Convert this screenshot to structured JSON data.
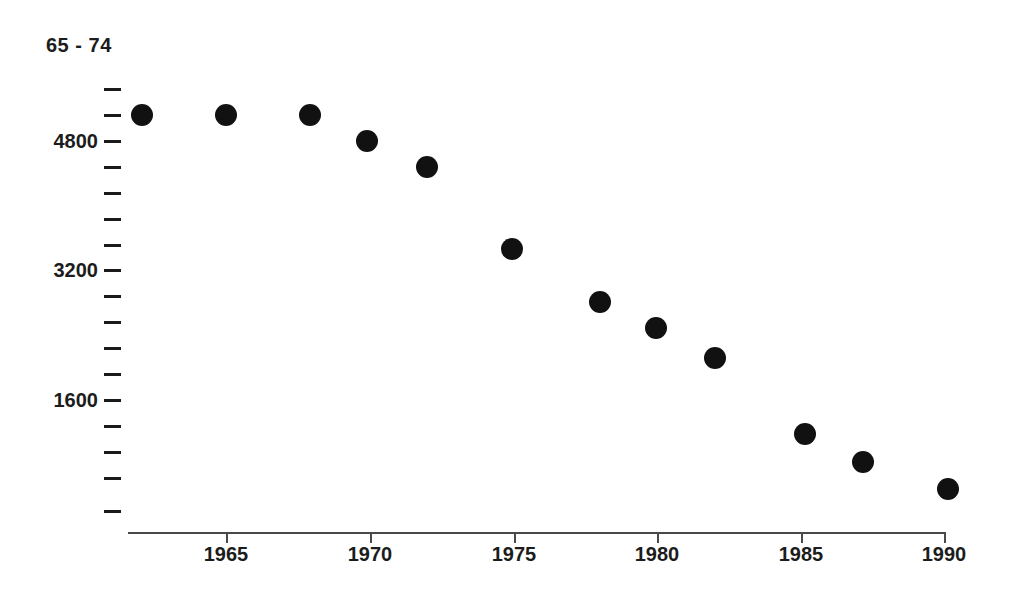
{
  "chart_data": {
    "type": "scatter",
    "title": "65 - 74",
    "xlabel": "",
    "ylabel": "",
    "grid": false,
    "legend_position": "none",
    "marker": {
      "shape": "circle",
      "color": "#111111",
      "size_px": 22
    },
    "axis_color": "#4a4a4a",
    "text_color": "#1c1c1c",
    "background_color": "#ffffff",
    "xlim": [
      1961,
      1991
    ],
    "ylim": [
      0,
      5600
    ],
    "x_tick_labels": [
      "1965",
      "1970",
      "1975",
      "1980",
      "1985",
      "1990"
    ],
    "x_tick_values": [
      1965,
      1970,
      1975,
      1980,
      1985,
      1990
    ],
    "y_tick_labels": [
      "4800",
      "3200",
      "1600"
    ],
    "y_tick_values": [
      4800,
      3200,
      1600
    ],
    "y_minor_tick_values": [
      5440,
      5120,
      4480,
      4160,
      3840,
      3520,
      2880,
      2560,
      2240,
      1920,
      1280,
      960,
      640,
      320
    ],
    "y_tick_step": 320,
    "x": [
      1962,
      1965,
      1968,
      1970,
      1972,
      1975,
      1978,
      1980,
      1982,
      1985,
      1987,
      1990
    ],
    "values": [
      5120,
      5120,
      5120,
      4800,
      4480,
      3470,
      2800,
      2480,
      2120,
      1180,
      830,
      500
    ],
    "points": [
      {
        "x": 1962,
        "y": 5120
      },
      {
        "x": 1965,
        "y": 5120
      },
      {
        "x": 1968,
        "y": 5120
      },
      {
        "x": 1970,
        "y": 4800
      },
      {
        "x": 1972,
        "y": 4480
      },
      {
        "x": 1975,
        "y": 3470
      },
      {
        "x": 1978,
        "y": 2800
      },
      {
        "x": 1980,
        "y": 2480
      },
      {
        "x": 1982,
        "y": 2120
      },
      {
        "x": 1985,
        "y": 1180
      },
      {
        "x": 1987,
        "y": 830
      },
      {
        "x": 1990,
        "y": 500
      }
    ]
  },
  "layout": {
    "series_label": {
      "text": "65 - 74",
      "left": 46,
      "top": 34
    },
    "y_axis": {
      "tick_x": 104,
      "label_right": 98,
      "ticks": [
        {
          "label": "",
          "y": 89
        },
        {
          "label": "",
          "y": 115
        },
        {
          "label": "4800",
          "y": 141
        },
        {
          "label": "",
          "y": 167
        },
        {
          "label": "",
          "y": 193
        },
        {
          "label": "",
          "y": 219
        },
        {
          "label": "",
          "y": 245
        },
        {
          "label": "3200",
          "y": 270
        },
        {
          "label": "",
          "y": 296
        },
        {
          "label": "",
          "y": 322
        },
        {
          "label": "",
          "y": 348
        },
        {
          "label": "",
          "y": 374
        },
        {
          "label": "1600",
          "y": 400
        },
        {
          "label": "",
          "y": 426
        },
        {
          "label": "",
          "y": 452
        },
        {
          "label": "",
          "y": 478
        },
        {
          "label": "",
          "y": 511
        }
      ]
    },
    "x_axis": {
      "line_left": 128,
      "line_width": 818,
      "line_y": 532,
      "label_y": 543,
      "ticks": [
        {
          "label": "1965",
          "x": 226
        },
        {
          "label": "1970",
          "x": 370
        },
        {
          "label": "1975",
          "x": 514
        },
        {
          "label": "1980",
          "x": 657
        },
        {
          "label": "1985",
          "x": 801
        },
        {
          "label": "1990",
          "x": 944
        }
      ]
    },
    "markers": [
      {
        "x": 142,
        "y": 115
      },
      {
        "x": 226,
        "y": 115
      },
      {
        "x": 310,
        "y": 115
      },
      {
        "x": 367,
        "y": 141
      },
      {
        "x": 427,
        "y": 167
      },
      {
        "x": 512,
        "y": 249
      },
      {
        "x": 600,
        "y": 302
      },
      {
        "x": 656,
        "y": 328
      },
      {
        "x": 715,
        "y": 358
      },
      {
        "x": 805,
        "y": 434
      },
      {
        "x": 863,
        "y": 462
      },
      {
        "x": 948,
        "y": 489
      }
    ]
  }
}
